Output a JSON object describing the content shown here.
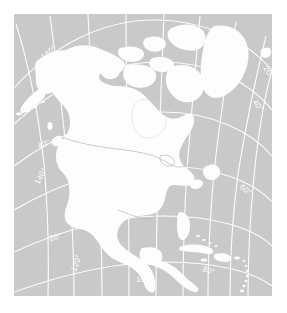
{
  "figure": {
    "projection": "Lambert conformal conic",
    "background_color": "#ffffff",
    "ocean_color": "#c9c9c9",
    "land_color": "#fdfdfd",
    "graticule_color": "#ffffff",
    "border_color": "#b4b4b4"
  },
  "graticule": {
    "longitude_labels": [
      {
        "id": "lon-180",
        "text": "180°",
        "x": 30,
        "y": 46,
        "rotate": -42
      },
      {
        "id": "lon-160",
        "text": "160°",
        "x": 23,
        "y": 86,
        "rotate": -50
      },
      {
        "id": "lon-140",
        "text": "140°",
        "x": 25,
        "y": 171,
        "rotate": -62
      },
      {
        "id": "lon-120",
        "text": "120°",
        "x": 62,
        "y": 258,
        "rotate": -72
      },
      {
        "id": "lon-100",
        "text": "100°",
        "x": 122,
        "y": 268,
        "rotate": 0
      },
      {
        "id": "lon-80",
        "text": "80°",
        "x": 188,
        "y": 257,
        "rotate": 18
      },
      {
        "id": "lon-60",
        "text": "60°",
        "x": 225,
        "y": 174,
        "rotate": 38
      },
      {
        "id": "lon-40",
        "text": "40°",
        "x": 238,
        "y": 88,
        "rotate": 52
      },
      {
        "id": "lon-20",
        "text": "20°",
        "x": 249,
        "y": 54,
        "rotate": 58
      }
    ],
    "latitude_labels": [
      {
        "id": "lat-60",
        "text": "60°",
        "x": 44,
        "y": 52,
        "rotate": -28
      },
      {
        "id": "lat-40",
        "text": "40°",
        "x": 25,
        "y": 135,
        "rotate": -22
      },
      {
        "id": "lat-20",
        "text": "20°",
        "x": 36,
        "y": 227,
        "rotate": -14
      }
    ],
    "meridian_interval_deg": 20,
    "parallel_interval_deg": 20
  },
  "features": {
    "landmasses": [
      "North American mainland",
      "Greenland",
      "Canadian Arctic Archipelago",
      "Alaska",
      "Aleutian Islands",
      "Baffin Island",
      "Newfoundland",
      "Vancouver Island",
      "Baja California",
      "Yucatan Peninsula",
      "Central America",
      "Cuba",
      "Hispaniola",
      "Jamaica",
      "Puerto Rico",
      "Lesser Antilles",
      "Bahamas",
      "Iceland"
    ],
    "boundaries": [
      "United States - Canada border",
      "United States - Mexico border"
    ],
    "water_bodies": [
      "Hudson Bay",
      "Great Lakes",
      "Gulf of Mexico",
      "Caribbean Sea"
    ]
  }
}
